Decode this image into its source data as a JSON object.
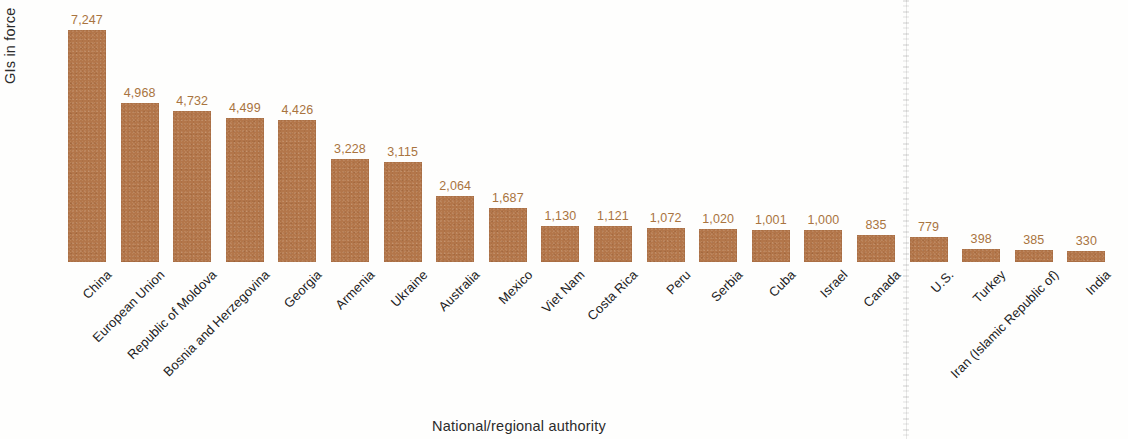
{
  "chart_data": {
    "type": "bar",
    "title": "",
    "xlabel": "National/regional authority",
    "ylabel": "GIs in force",
    "grid": false,
    "legend": "none",
    "ylim": [
      0,
      7247
    ],
    "value_label_color": "#a9743f",
    "bar_color": "#b3764a",
    "categories": [
      "China",
      "European Union",
      "Republic of Moldova",
      "Bosnia and Herzegovina",
      "Georgia",
      "Armenia",
      "Ukraine",
      "Australia",
      "Mexico",
      "Viet Nam",
      "Costa Rica",
      "Peru",
      "Serbia",
      "Cuba",
      "Israel",
      "Canada",
      "U.S.",
      "Turkey",
      "Iran (Islamic Republic of)",
      "India"
    ],
    "values": [
      7247,
      4968,
      4732,
      4499,
      4426,
      3228,
      3115,
      2064,
      1687,
      1130,
      1121,
      1072,
      1020,
      1001,
      1000,
      835,
      779,
      398,
      385,
      330
    ],
    "value_labels": [
      "7,247",
      "4,968",
      "4,732",
      "4,499",
      "4,426",
      "3,228",
      "3,115",
      "2,064",
      "1,687",
      "1,130",
      "1,121",
      "1,072",
      "1,020",
      "1,001",
      "1,000",
      "835",
      "779",
      "398",
      "385",
      "330"
    ]
  },
  "artifacts": {
    "scan_line_note": "vertical scan streak"
  }
}
